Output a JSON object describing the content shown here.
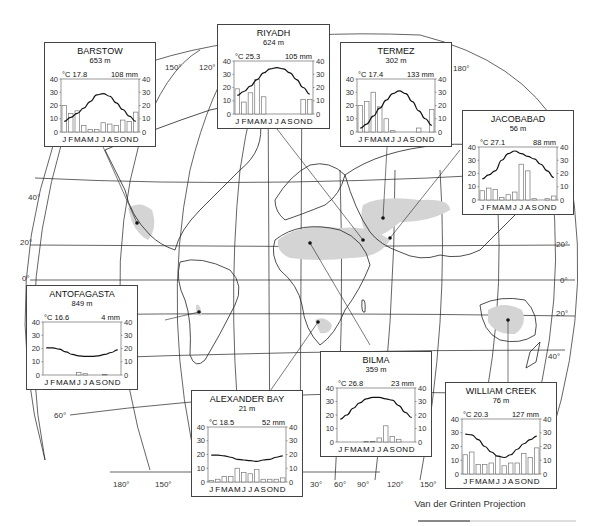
{
  "figure": {
    "projection_label": "Van der Grinten Projection",
    "latitude_labels": [
      "40°",
      "20°",
      "0°",
      "20°",
      "40°",
      "60°"
    ],
    "longitude_labels": [
      "180°",
      "150°",
      "120°",
      "150°",
      "180°",
      "30°",
      "60°",
      "90°",
      "120°",
      "150°"
    ],
    "desert_fill_color": "#d4d4d4",
    "line_color": "#1a1a1a"
  },
  "chart_data": [
    {
      "type": "bar+line",
      "title": "BARSTOW",
      "elevation": "653 m",
      "mean_temp_label": "°C 17.8",
      "annual_precip_label": "108 mm",
      "categories": [
        "J",
        "F",
        "M",
        "A",
        "M",
        "J",
        "J",
        "A",
        "S",
        "O",
        "N",
        "D"
      ],
      "series": [
        {
          "name": "Temperature (°C)",
          "type": "line",
          "values": [
            8,
            11,
            14,
            18,
            23,
            28,
            29,
            27,
            22,
            17,
            12,
            8
          ]
        },
        {
          "name": "Precipitation (mm)",
          "type": "bar",
          "values": [
            20,
            14,
            16,
            5,
            2,
            2,
            7,
            6,
            5,
            9,
            8,
            15
          ]
        }
      ],
      "ylim": [
        0,
        40
      ],
      "yticks": [
        0,
        10,
        20,
        30,
        40
      ]
    },
    {
      "type": "bar+line",
      "title": "RIYADH",
      "elevation": "624 m",
      "mean_temp_label": "°C 25.3",
      "annual_precip_label": "105 mm",
      "categories": [
        "J",
        "F",
        "M",
        "A",
        "M",
        "J",
        "J",
        "A",
        "S",
        "O",
        "N",
        "D"
      ],
      "series": [
        {
          "name": "Temperature (°C)",
          "type": "line",
          "values": [
            14,
            17,
            21,
            26,
            31,
            34,
            35,
            34,
            31,
            26,
            20,
            15
          ]
        },
        {
          "name": "Precipitation (mm)",
          "type": "bar",
          "values": [
            19,
            9,
            16,
            26,
            13,
            0,
            0,
            0,
            0,
            0,
            11,
            11
          ]
        }
      ],
      "ylim": [
        0,
        40
      ],
      "yticks": [
        0,
        10,
        20,
        30,
        40
      ]
    },
    {
      "type": "bar+line",
      "title": "TERMEZ",
      "elevation": "302 m",
      "mean_temp_label": "°C 17.4",
      "annual_precip_label": "133 mm",
      "categories": [
        "J",
        "F",
        "M",
        "A",
        "M",
        "J",
        "J",
        "A",
        "S",
        "O",
        "N",
        "D"
      ],
      "series": [
        {
          "name": "Temperature (°C)",
          "type": "line",
          "values": [
            3,
            6,
            12,
            18,
            24,
            29,
            31,
            29,
            23,
            16,
            10,
            5
          ]
        },
        {
          "name": "Precipitation (mm)",
          "type": "bar",
          "values": [
            20,
            23,
            30,
            19,
            10,
            1,
            0,
            0,
            0,
            3,
            0,
            17
          ]
        }
      ],
      "ylim": [
        0,
        40
      ],
      "yticks": [
        0,
        10,
        20,
        30,
        40
      ]
    },
    {
      "type": "bar+line",
      "title": "JACOBABAD",
      "elevation": "56 m",
      "mean_temp_label": "°C 27.1",
      "annual_precip_label": "88 mm",
      "categories": [
        "J",
        "F",
        "M",
        "A",
        "M",
        "J",
        "J",
        "A",
        "S",
        "O",
        "N",
        "D"
      ],
      "series": [
        {
          "name": "Temperature (°C)",
          "type": "line",
          "values": [
            16,
            19,
            22,
            30,
            35,
            37,
            35,
            33,
            31,
            27,
            22,
            17
          ]
        },
        {
          "name": "Precipitation (mm)",
          "type": "bar",
          "values": [
            7,
            9,
            8,
            2,
            4,
            6,
            27,
            22,
            1,
            0,
            1,
            3
          ]
        }
      ],
      "ylim": [
        0,
        40
      ],
      "yticks": [
        0,
        10,
        20,
        30,
        40
      ]
    },
    {
      "type": "bar+line",
      "title": "ANTOFAGASTA",
      "elevation": "849 m",
      "mean_temp_label": "°C 16.6",
      "annual_precip_label": "4 mm",
      "categories": [
        "J",
        "F",
        "M",
        "A",
        "M",
        "J",
        "J",
        "A",
        "S",
        "O",
        "N",
        "D"
      ],
      "series": [
        {
          "name": "Temperature (°C)",
          "type": "line",
          "values": [
            20.5,
            20.5,
            19.5,
            17.5,
            15.5,
            14.5,
            14,
            14,
            14.5,
            15.5,
            17,
            19
          ]
        },
        {
          "name": "Precipitation (mm)",
          "type": "bar",
          "values": [
            0,
            0,
            0,
            0,
            0,
            2,
            1,
            0,
            0,
            0.5,
            0,
            0
          ]
        }
      ],
      "ylim": [
        0,
        40
      ],
      "yticks": [
        0,
        10,
        20,
        30,
        40
      ]
    },
    {
      "type": "bar+line",
      "title": "ALEXANDER BAY",
      "elevation": "21 m",
      "mean_temp_label": "°C 18.5",
      "annual_precip_label": "52 mm",
      "categories": [
        "J",
        "F",
        "M",
        "A",
        "M",
        "J",
        "J",
        "A",
        "S",
        "O",
        "N",
        "D"
      ],
      "series": [
        {
          "name": "Temperature (°C)",
          "type": "line",
          "values": [
            19.5,
            19.5,
            19,
            18,
            16.5,
            16,
            15.5,
            15,
            16,
            16.5,
            18,
            19
          ]
        },
        {
          "name": "Precipitation (mm)",
          "type": "bar",
          "values": [
            1,
            2,
            4,
            4,
            10,
            7,
            6,
            9,
            2,
            2,
            2,
            3
          ]
        }
      ],
      "ylim": [
        0,
        40
      ],
      "yticks": [
        0,
        10,
        20,
        30,
        40
      ]
    },
    {
      "type": "bar+line",
      "title": "BILMA",
      "elevation": "359 m",
      "mean_temp_label": "°C 26.8",
      "annual_precip_label": "23 mm",
      "categories": [
        "J",
        "F",
        "M",
        "A",
        "M",
        "J",
        "J",
        "A",
        "S",
        "O",
        "N",
        "D"
      ],
      "series": [
        {
          "name": "Temperature (°C)",
          "type": "line",
          "values": [
            17,
            20,
            25,
            29,
            32,
            33,
            33,
            32,
            31,
            27,
            22,
            18
          ]
        },
        {
          "name": "Precipitation (mm)",
          "type": "bar",
          "values": [
            0,
            0,
            0,
            0,
            0.5,
            0.5,
            3,
            12,
            4,
            2,
            0,
            0
          ]
        }
      ],
      "ylim": [
        0,
        40
      ],
      "yticks": [
        0,
        10,
        20,
        30,
        40
      ]
    },
    {
      "type": "bar+line",
      "title": "WILLIAM CREEK",
      "elevation": "76 m",
      "mean_temp_label": "°C 20.3",
      "annual_precip_label": "127 mm",
      "categories": [
        "J",
        "F",
        "M",
        "A",
        "M",
        "J",
        "J",
        "A",
        "S",
        "O",
        "N",
        "D"
      ],
      "series": [
        {
          "name": "Temperature (°C)",
          "type": "line",
          "values": [
            29,
            28.5,
            25,
            20,
            16,
            13,
            12,
            14,
            18,
            22,
            25,
            27.5
          ]
        },
        {
          "name": "Precipitation (mm)",
          "type": "bar",
          "values": [
            14,
            16,
            7,
            7,
            8,
            13,
            6,
            8,
            8,
            15,
            12,
            19
          ]
        }
      ],
      "ylim": [
        0,
        40
      ],
      "yticks": [
        0,
        10,
        20,
        30,
        40
      ]
    }
  ]
}
